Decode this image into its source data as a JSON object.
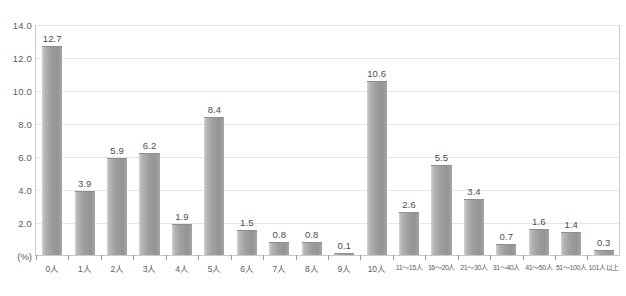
{
  "chart_data": {
    "type": "bar",
    "title": "",
    "subtitle": "",
    "xlabel": "",
    "ylabel": "(%)",
    "ylim": [
      0,
      14
    ],
    "ytick_step": 2,
    "grid": true,
    "legend": false,
    "legend_position": "none",
    "bar_color": "#9e9e9e",
    "categories": [
      "0人",
      "1人",
      "2人",
      "3人",
      "4人",
      "5人",
      "6人",
      "7人",
      "8人",
      "9人",
      "10人",
      "11～15人",
      "16～20人",
      "21～30人",
      "31～40人",
      "41～50人",
      "51～100人",
      "101人以上"
    ],
    "values": [
      12.7,
      3.9,
      5.9,
      6.2,
      1.9,
      8.4,
      1.5,
      0.8,
      0.8,
      0.1,
      10.6,
      2.6,
      5.5,
      3.4,
      0.7,
      1.6,
      1.4,
      0.3
    ],
    "value_labels": [
      "12.7",
      "3.9",
      "5.9",
      "6.2",
      "1.9",
      "8.4",
      "1.5",
      "0.8",
      "0.8",
      "0.1",
      "10.6",
      "2.6",
      "5.5",
      "3.4",
      "0.7",
      "1.6",
      "1.4",
      "0.3"
    ],
    "ytick_labels": [
      "14.0",
      "12.0",
      "10.0",
      "8.0",
      "6.0",
      "4.0",
      "2.0"
    ],
    "ytick_values": [
      14.0,
      12.0,
      10.0,
      8.0,
      6.0,
      4.0,
      2.0
    ],
    "y_unit_label": "(%)"
  }
}
